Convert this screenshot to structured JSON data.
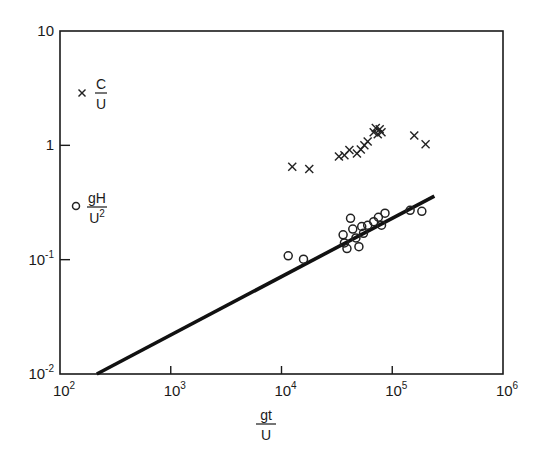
{
  "chart_data": {
    "type": "scatter",
    "title": "",
    "xscale": "log",
    "yscale": "log",
    "xlim": [
      100,
      1000000
    ],
    "ylim": [
      0.01,
      10
    ],
    "xlabel": {
      "numerator": "gt",
      "denominator": "U"
    },
    "ylabel": "",
    "x_ticks": [
      {
        "value": 100,
        "base": "10",
        "exp": "2"
      },
      {
        "value": 1000,
        "base": "10",
        "exp": "3"
      },
      {
        "value": 10000,
        "base": "10",
        "exp": "4"
      },
      {
        "value": 100000,
        "base": "10",
        "exp": "5"
      },
      {
        "value": 1000000,
        "base": "10",
        "exp": "6"
      }
    ],
    "y_ticks": [
      {
        "value": 10,
        "base": "10",
        "exp": ""
      },
      {
        "value": 1,
        "base": "1",
        "exp": ""
      },
      {
        "value": 0.1,
        "base": "10",
        "exp": "-1"
      },
      {
        "value": 0.01,
        "base": "10",
        "exp": "-2"
      }
    ],
    "grid": false,
    "legend": {
      "position": "upper-left inside",
      "entries": [
        {
          "marker": "x",
          "numerator": "C",
          "denominator": "U",
          "denominator_sup": ""
        },
        {
          "marker": "o",
          "numerator": "gH",
          "denominator": "U",
          "denominator_sup": "2"
        }
      ]
    },
    "series": [
      {
        "name": "C/U",
        "marker": "x",
        "points": [
          [
            12500,
            0.65
          ],
          [
            17800,
            0.62
          ],
          [
            33000,
            0.8
          ],
          [
            37000,
            0.82
          ],
          [
            41000,
            0.91
          ],
          [
            48000,
            0.85
          ],
          [
            52000,
            0.92
          ],
          [
            56000,
            1.0
          ],
          [
            60000,
            1.08
          ],
          [
            68000,
            1.3
          ],
          [
            71000,
            1.42
          ],
          [
            74000,
            1.25
          ],
          [
            77000,
            1.38
          ],
          [
            80000,
            1.3
          ],
          [
            158000,
            1.22
          ],
          [
            200000,
            1.02
          ]
        ]
      },
      {
        "name": "gH/U^2",
        "marker": "o",
        "points": [
          [
            11500,
            0.108
          ],
          [
            15800,
            0.101
          ],
          [
            36000,
            0.165
          ],
          [
            37000,
            0.14
          ],
          [
            39000,
            0.125
          ],
          [
            42000,
            0.23
          ],
          [
            44000,
            0.185
          ],
          [
            47000,
            0.155
          ],
          [
            50000,
            0.13
          ],
          [
            53000,
            0.195
          ],
          [
            55000,
            0.17
          ],
          [
            60000,
            0.2
          ],
          [
            68000,
            0.215
          ],
          [
            75000,
            0.235
          ],
          [
            80000,
            0.2
          ],
          [
            86000,
            0.255
          ],
          [
            145000,
            0.27
          ],
          [
            185000,
            0.265
          ]
        ]
      },
      {
        "name": "fit line",
        "type": "line",
        "points": [
          [
            215,
            0.01
          ],
          [
            240000,
            0.36
          ]
        ]
      }
    ]
  }
}
